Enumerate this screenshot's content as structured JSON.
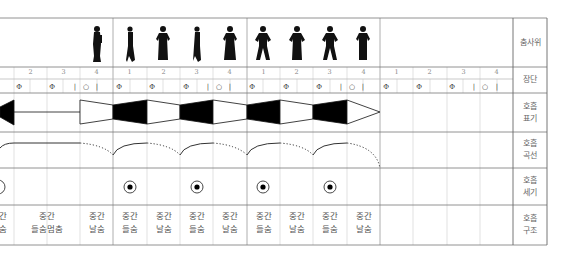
{
  "labels": {
    "dance": "춤사위",
    "jangdan": "장단",
    "breath_notation": [
      "호흡",
      "표기"
    ],
    "breath_curve": [
      "호흡",
      "곡선"
    ],
    "breath_strength": [
      "호흡",
      "세기"
    ],
    "breath_structure": [
      "호흡",
      "구조"
    ]
  },
  "beats": [
    {
      "x": 14,
      "num": "2"
    },
    {
      "x": 47,
      "num": "3"
    },
    {
      "x": 80,
      "num": "4"
    },
    {
      "x": 113,
      "num": "1"
    },
    {
      "x": 147,
      "num": "2"
    },
    {
      "x": 180,
      "num": "3"
    },
    {
      "x": 213,
      "num": "4"
    },
    {
      "x": 247,
      "num": "1"
    },
    {
      "x": 280,
      "num": "2"
    },
    {
      "x": 313,
      "num": "3"
    },
    {
      "x": 347,
      "num": "4"
    },
    {
      "x": 380,
      "num": "1"
    },
    {
      "x": 413,
      "num": "2"
    },
    {
      "x": 447,
      "num": "3"
    },
    {
      "x": 480,
      "num": "4"
    }
  ],
  "jangdan_symbols": {
    "pattern": [
      "Φ",
      "Φ",
      "Φ",
      "| ○ |"
    ],
    "description": "12/8 jangdan notation: Φ on beats 1-3, | ○ | on beat 4"
  },
  "breath_structure": [
    {
      "x": -14,
      "w": 33,
      "lines": [
        "간",
        "숨"
      ]
    },
    {
      "x": 14,
      "w": 66,
      "lines": [
        "중간",
        "들숨멈춤"
      ]
    },
    {
      "x": 80,
      "w": 33,
      "lines": [
        "중간",
        "날숨"
      ]
    },
    {
      "x": 113,
      "w": 33,
      "lines": [
        "중간",
        "들숨"
      ]
    },
    {
      "x": 147,
      "w": 33,
      "lines": [
        "중간",
        "날숨"
      ]
    },
    {
      "x": 180,
      "w": 33,
      "lines": [
        "중간",
        "들숨"
      ]
    },
    {
      "x": 213,
      "w": 33,
      "lines": [
        "중간",
        "날숨"
      ]
    },
    {
      "x": 247,
      "w": 33,
      "lines": [
        "중간",
        "들숨"
      ]
    },
    {
      "x": 280,
      "w": 33,
      "lines": [
        "중간",
        "날숨"
      ]
    },
    {
      "x": 313,
      "w": 33,
      "lines": [
        "중간",
        "들숨"
      ]
    },
    {
      "x": 347,
      "w": 33,
      "lines": [
        "중간",
        "날숨"
      ]
    }
  ],
  "strength_marks": [
    130,
    197,
    263,
    330
  ],
  "figure_count": 9,
  "colors": {
    "grid": "#bbbbbb",
    "border": "#555555",
    "ink": "#000000"
  }
}
